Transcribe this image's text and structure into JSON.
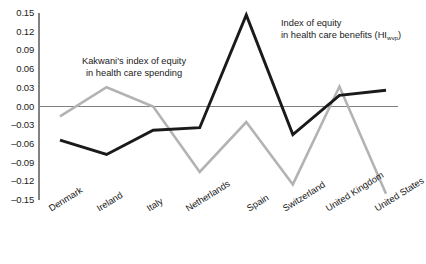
{
  "chart_data": {
    "type": "line",
    "title": "",
    "xlabel": "",
    "ylabel": "",
    "ylim": [
      -0.15,
      0.15
    ],
    "ytick_values": [
      0.15,
      0.12,
      0.09,
      0.06,
      0.03,
      0.0,
      -0.03,
      -0.06,
      -0.09,
      -0.12,
      -0.15
    ],
    "ytick_labels": [
      "0.15",
      "0.12",
      "0.09",
      "0.06",
      "0.03",
      "0.00",
      "–0.03",
      "–0.06",
      "–0.09",
      "–0.12",
      "–0.15"
    ],
    "grid": false,
    "zero_line": true,
    "legend_position": "inline-annotations",
    "categories": [
      "Denmark",
      "Ireland",
      "Italy",
      "Netherlands",
      "Spain",
      "Switzerland",
      "United Kingdom",
      "United States"
    ],
    "series": [
      {
        "name": "Index of equity in health care benefits (HIwvp)",
        "color": "#1a1a1a",
        "values": [
          -0.054,
          -0.077,
          -0.038,
          -0.034,
          0.147,
          -0.045,
          0.018,
          0.026
        ]
      },
      {
        "name": "Kakwani's index of equity in health care spending",
        "color": "#b3b3b3",
        "values": [
          -0.016,
          0.031,
          0.0,
          -0.105,
          -0.025,
          -0.125,
          0.032,
          -0.14
        ]
      }
    ],
    "annotations": [
      {
        "id": "spending",
        "line1": "Kakwani's index of equity",
        "line2": "in health care spending"
      },
      {
        "id": "benefits",
        "line1": "Index of equity",
        "line2_prefix": "in health care benefits (HI",
        "line2_sub": "wvp",
        "line2_suffix": ")"
      }
    ]
  }
}
